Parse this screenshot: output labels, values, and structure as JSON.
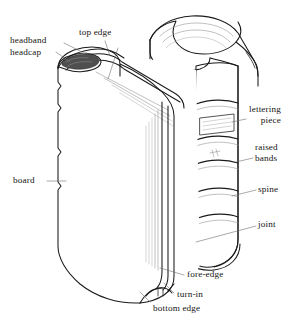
{
  "diagram": {
    "style": "pen-and-ink line drawing, black line art on white background",
    "colors": {
      "background": "#ffffff",
      "ink": "#1a1a1a",
      "line_light": "#8d8d8d",
      "leader_line": "#7a7a7a",
      "headband_shade": "#4a4a4a",
      "paper_edge": "#b9b9b9"
    }
  },
  "labels": [
    {
      "id": "headband",
      "text": "headband",
      "lines": [
        "headband"
      ],
      "x": 10,
      "y": 37,
      "align": "left"
    },
    {
      "id": "headcap",
      "text": "headcap",
      "lines": [
        "headcap"
      ],
      "x": 10,
      "y": 49,
      "align": "left"
    },
    {
      "id": "top-edge",
      "text": "top edge",
      "lines": [
        "top edge"
      ],
      "x": 79,
      "y": 28,
      "align": "left"
    },
    {
      "id": "lettering-piece",
      "text": "lettering piece",
      "lines": [
        "lettering",
        "piece"
      ],
      "x": 248,
      "y": 105,
      "align": "left"
    },
    {
      "id": "raised-bands",
      "text": "raised bands",
      "lines": [
        "raised",
        "bands"
      ],
      "x": 255,
      "y": 143,
      "align": "left"
    },
    {
      "id": "spine",
      "text": "spine",
      "lines": [
        "spine"
      ],
      "x": 258,
      "y": 185,
      "align": "left"
    },
    {
      "id": "joint",
      "text": "joint",
      "lines": [
        "joint"
      ],
      "x": 258,
      "y": 220,
      "align": "left"
    },
    {
      "id": "board",
      "text": "board",
      "lines": [
        "board"
      ],
      "x": 13,
      "y": 176,
      "align": "left"
    },
    {
      "id": "fore-edge",
      "text": "fore-edge",
      "lines": [
        "fore-edge"
      ],
      "x": 186,
      "y": 271,
      "align": "left"
    },
    {
      "id": "turn-in",
      "text": "turn-in",
      "lines": [
        "turn-in"
      ],
      "x": 176,
      "y": 291,
      "align": "left"
    },
    {
      "id": "bottom-edge",
      "text": "bottom edge",
      "lines": [
        "bottom edge"
      ],
      "x": 153,
      "y": 305,
      "align": "left"
    }
  ],
  "parts": [
    {
      "name": "headband",
      "description": "dark shaded strip at the top of the spine between spine and text block"
    },
    {
      "name": "headcap",
      "description": "shaped covering material at the head of the spine"
    },
    {
      "name": "top edge",
      "description": "top edge of the text block pages"
    },
    {
      "name": "lettering piece",
      "description": "rectangular label panel on the spine between two raised bands"
    },
    {
      "name": "raised bands",
      "description": "horizontal ridges running across the spine"
    },
    {
      "name": "spine",
      "description": "the covered back of the book where the sections are joined"
    },
    {
      "name": "joint",
      "description": "the hinge groove between the spine and the board"
    },
    {
      "name": "board",
      "description": "the stiff front cover board"
    },
    {
      "name": "fore-edge",
      "description": "the front vertical edge of the text block opposite the spine"
    },
    {
      "name": "turn-in",
      "description": "the covering material folded over the board edge to the inside"
    },
    {
      "name": "bottom edge",
      "description": "bottom edge of the text block pages"
    }
  ]
}
